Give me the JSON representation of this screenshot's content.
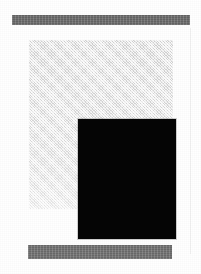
{
  "page": {
    "width": 201,
    "height": 274,
    "background_color": "#ffffff",
    "media": "scanned-document-figure",
    "caption": ""
  },
  "elements": {
    "top_banner": {
      "label": "",
      "color": "#6e6e6e",
      "x": 12,
      "y": 15,
      "width": 178,
      "height": 10
    },
    "bottom_banner": {
      "label": "",
      "color": "#757575",
      "x": 28,
      "y": 245,
      "width": 144,
      "height": 14
    },
    "figure_panel": {
      "label": "",
      "color": "#e9e9e9",
      "x": 29,
      "y": 40,
      "width": 144,
      "height": 169
    },
    "figure_plate": {
      "label": "",
      "color": "#050505",
      "x": 49,
      "y": 79,
      "width": 98,
      "height": 120
    },
    "right_gutter_line": {
      "label": "",
      "color": "#f0f0f0",
      "x": 190,
      "y": 28,
      "width": 1,
      "height": 226
    }
  }
}
